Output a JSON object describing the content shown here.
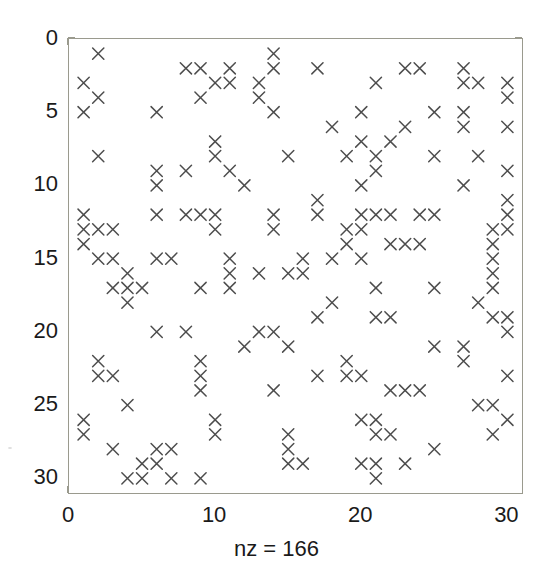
{
  "figure": {
    "type": "spy-plot",
    "background_color": "#ffffff",
    "axis_color": "#9a9a8e",
    "marker_color": "#4d4d4d",
    "text_color": "#1a1a1a"
  },
  "xlabel": "nz = 166",
  "axis": {
    "x_ticks": [
      "0",
      "10",
      "20",
      "30"
    ],
    "x_tick_values": [
      0,
      10,
      20,
      30
    ],
    "y_ticks": [
      "0",
      "5",
      "10",
      "15",
      "20",
      "25",
      "30"
    ],
    "y_tick_values": [
      0,
      5,
      10,
      15,
      20,
      25,
      30
    ],
    "xlim": [
      0,
      31
    ],
    "ylim": [
      0,
      31
    ],
    "y_inverted": true,
    "grid": false
  },
  "chart_data": {
    "type": "scatter",
    "title": "",
    "xlabel": "nz = 166",
    "ylabel": "",
    "xlim": [
      0,
      31
    ],
    "ylim": [
      31,
      0
    ],
    "grid": false,
    "legend": "none",
    "marker": "x",
    "marker_color": "#4d4d4d",
    "nz": 166,
    "matrix_size": [
      30,
      30
    ],
    "xticks": [
      0,
      10,
      20,
      30
    ],
    "yticks": [
      0,
      5,
      10,
      15,
      20,
      25,
      30
    ],
    "points": [
      [
        2,
        1
      ],
      [
        14,
        1
      ],
      [
        8,
        2
      ],
      [
        9,
        2
      ],
      [
        11,
        2
      ],
      [
        14,
        2
      ],
      [
        17,
        2
      ],
      [
        23,
        2
      ],
      [
        24,
        2
      ],
      [
        27,
        2
      ],
      [
        1,
        3
      ],
      [
        10,
        3
      ],
      [
        11,
        3
      ],
      [
        13,
        3
      ],
      [
        21,
        3
      ],
      [
        27,
        3
      ],
      [
        28,
        3
      ],
      [
        30,
        3
      ],
      [
        2,
        4
      ],
      [
        9,
        4
      ],
      [
        13,
        4
      ],
      [
        30,
        4
      ],
      [
        1,
        5
      ],
      [
        6,
        5
      ],
      [
        14,
        5
      ],
      [
        20,
        5
      ],
      [
        25,
        5
      ],
      [
        27,
        5
      ],
      [
        18,
        6
      ],
      [
        23,
        6
      ],
      [
        27,
        6
      ],
      [
        30,
        6
      ],
      [
        10,
        7
      ],
      [
        20,
        7
      ],
      [
        22,
        7
      ],
      [
        2,
        8
      ],
      [
        10,
        8
      ],
      [
        15,
        8
      ],
      [
        19,
        8
      ],
      [
        21,
        8
      ],
      [
        25,
        8
      ],
      [
        28,
        8
      ],
      [
        6,
        9
      ],
      [
        8,
        9
      ],
      [
        11,
        9
      ],
      [
        21,
        9
      ],
      [
        30,
        9
      ],
      [
        6,
        10
      ],
      [
        12,
        10
      ],
      [
        20,
        10
      ],
      [
        27,
        10
      ],
      [
        17,
        11
      ],
      [
        30,
        11
      ],
      [
        1,
        12
      ],
      [
        6,
        12
      ],
      [
        8,
        12
      ],
      [
        9,
        12
      ],
      [
        10,
        12
      ],
      [
        14,
        12
      ],
      [
        17,
        12
      ],
      [
        20,
        12
      ],
      [
        21,
        12
      ],
      [
        22,
        12
      ],
      [
        24,
        12
      ],
      [
        25,
        12
      ],
      [
        30,
        12
      ],
      [
        1,
        13
      ],
      [
        2,
        13
      ],
      [
        3,
        13
      ],
      [
        10,
        13
      ],
      [
        14,
        13
      ],
      [
        19,
        13
      ],
      [
        20,
        13
      ],
      [
        29,
        13
      ],
      [
        30,
        13
      ],
      [
        1,
        14
      ],
      [
        19,
        14
      ],
      [
        22,
        14
      ],
      [
        23,
        14
      ],
      [
        24,
        14
      ],
      [
        29,
        14
      ],
      [
        2,
        15
      ],
      [
        3,
        15
      ],
      [
        6,
        15
      ],
      [
        7,
        15
      ],
      [
        11,
        15
      ],
      [
        16,
        15
      ],
      [
        18,
        15
      ],
      [
        20,
        15
      ],
      [
        29,
        15
      ],
      [
        4,
        16
      ],
      [
        11,
        16
      ],
      [
        13,
        16
      ],
      [
        15,
        16
      ],
      [
        16,
        16
      ],
      [
        29,
        16
      ],
      [
        3,
        17
      ],
      [
        4,
        17
      ],
      [
        5,
        17
      ],
      [
        9,
        17
      ],
      [
        11,
        17
      ],
      [
        21,
        17
      ],
      [
        25,
        17
      ],
      [
        29,
        17
      ],
      [
        4,
        18
      ],
      [
        18,
        18
      ],
      [
        28,
        18
      ],
      [
        17,
        19
      ],
      [
        21,
        19
      ],
      [
        22,
        19
      ],
      [
        29,
        19
      ],
      [
        30,
        19
      ],
      [
        6,
        20
      ],
      [
        8,
        20
      ],
      [
        13,
        20
      ],
      [
        14,
        20
      ],
      [
        30,
        20
      ],
      [
        12,
        21
      ],
      [
        15,
        21
      ],
      [
        25,
        21
      ],
      [
        27,
        21
      ],
      [
        2,
        22
      ],
      [
        9,
        22
      ],
      [
        19,
        22
      ],
      [
        27,
        22
      ],
      [
        2,
        23
      ],
      [
        3,
        23
      ],
      [
        9,
        23
      ],
      [
        17,
        23
      ],
      [
        19,
        23
      ],
      [
        20,
        23
      ],
      [
        30,
        23
      ],
      [
        9,
        24
      ],
      [
        14,
        24
      ],
      [
        22,
        24
      ],
      [
        23,
        24
      ],
      [
        24,
        24
      ],
      [
        4,
        25
      ],
      [
        28,
        25
      ],
      [
        29,
        25
      ],
      [
        1,
        26
      ],
      [
        10,
        26
      ],
      [
        20,
        26
      ],
      [
        21,
        26
      ],
      [
        30,
        26
      ],
      [
        1,
        27
      ],
      [
        10,
        27
      ],
      [
        15,
        27
      ],
      [
        21,
        27
      ],
      [
        22,
        27
      ],
      [
        29,
        27
      ],
      [
        3,
        28
      ],
      [
        6,
        28
      ],
      [
        7,
        28
      ],
      [
        15,
        28
      ],
      [
        25,
        28
      ],
      [
        5,
        29
      ],
      [
        6,
        29
      ],
      [
        15,
        29
      ],
      [
        16,
        29
      ],
      [
        20,
        29
      ],
      [
        21,
        29
      ],
      [
        23,
        29
      ],
      [
        4,
        30
      ],
      [
        5,
        30
      ],
      [
        7,
        30
      ],
      [
        9,
        30
      ],
      [
        21,
        30
      ]
    ]
  }
}
